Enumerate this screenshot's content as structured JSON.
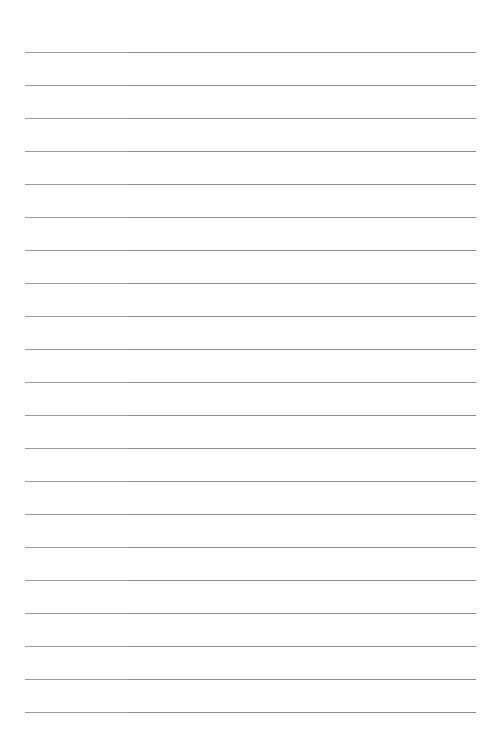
{
  "page": {
    "type": "lined-paper",
    "line_count": 21,
    "line_color": "#8c8c8c",
    "line_color_left": "#9a9a9a",
    "background": "#ffffff"
  }
}
